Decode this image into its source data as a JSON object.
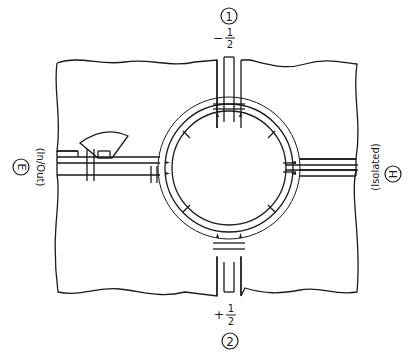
{
  "diagram": {
    "ports": {
      "port1": {
        "number": "1",
        "phase": "-1/2",
        "phase_sign": "−",
        "phase_num": "1",
        "phase_den": "2"
      },
      "port2": {
        "number": "2",
        "phase": "+1/2",
        "phase_sign": "+",
        "phase_num": "1",
        "phase_den": "2"
      },
      "portE": {
        "letter": "E",
        "role": "(In/Out)"
      },
      "portH": {
        "letter": "H",
        "role": "(Isolated)"
      }
    },
    "colors": {
      "line": "#1a1a1a",
      "background": "#ffffff"
    }
  }
}
